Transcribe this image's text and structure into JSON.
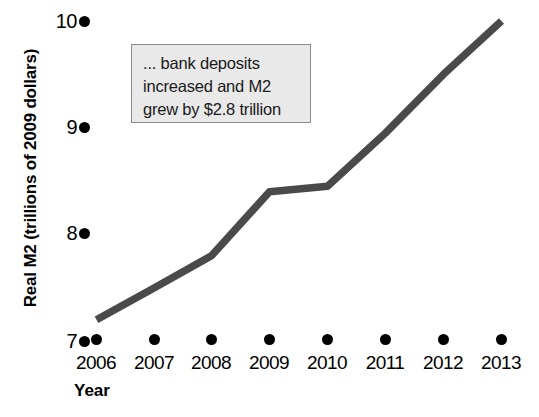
{
  "chart_data": {
    "type": "line",
    "title": "",
    "xlabel": "Year",
    "ylabel": "Real M2 (trillions of 2009 dollars)",
    "categories": [
      "2006",
      "2007",
      "2008",
      "2009",
      "2010",
      "2011",
      "2012",
      "2013"
    ],
    "values": [
      7.2,
      7.5,
      7.8,
      8.4,
      8.45,
      8.95,
      9.5,
      10.0
    ],
    "series": [
      {
        "name": "Real M2",
        "values": [
          7.2,
          7.5,
          7.8,
          8.4,
          8.45,
          8.95,
          9.5,
          10.0
        ]
      }
    ],
    "ylim": [
      7,
      10
    ],
    "yticks": [
      7,
      8,
      9,
      10
    ],
    "ytick_labels": [
      "7",
      "8",
      "9",
      "10"
    ],
    "xlim": [
      "2006",
      "2013"
    ],
    "grid": false,
    "legend": "none",
    "line_color": "#4a4a4a",
    "tick_marker_color": "#000000",
    "annotations": [
      {
        "lines": [
          "... bank deposits",
          "increased and M2",
          "grew by $2.8 trillion"
        ],
        "fill_color": "#e9e9e9",
        "border_color": "#8a8a8a"
      }
    ]
  },
  "axes": {
    "y_title": "Real M2 (trillions of 2009 dollars)",
    "x_title": "Year",
    "y_ticks": [
      {
        "label": "10",
        "top": 9
      },
      {
        "label": "9",
        "top": 115
      },
      {
        "label": "8",
        "top": 221
      },
      {
        "label": "7",
        "top": 329
      }
    ],
    "x_ticks": [
      {
        "label": "2006",
        "dot_left": 91,
        "label_left": 64
      },
      {
        "label": "2007",
        "dot_left": 149,
        "label_left": 122
      },
      {
        "label": "2008",
        "dot_left": 206,
        "label_left": 179
      },
      {
        "label": "2009",
        "dot_left": 264,
        "label_left": 237
      },
      {
        "label": "2010",
        "dot_left": 322,
        "label_left": 295
      },
      {
        "label": "2011",
        "dot_left": 380,
        "label_left": 353
      },
      {
        "label": "2012",
        "dot_left": 438,
        "label_left": 411
      },
      {
        "label": "2013",
        "dot_left": 496,
        "label_left": 469
      }
    ],
    "x_dot_top": 334
  },
  "annotation": {
    "line1": "... bank deposits",
    "line2": "increased and M2",
    "line3": "grew by $2.8 trillion"
  }
}
